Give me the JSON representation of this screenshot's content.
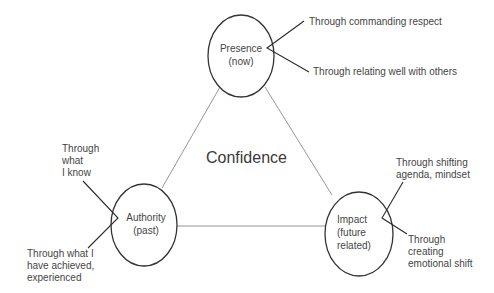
{
  "diagram": {
    "center_label": "Confidence",
    "nodes": [
      {
        "id": "presence",
        "label": [
          "Presence",
          "(now)"
        ],
        "annotations": [
          {
            "text": [
              "Through commanding respect"
            ]
          },
          {
            "text": [
              "Through relating well with others"
            ]
          }
        ]
      },
      {
        "id": "authority",
        "label": [
          "Authority",
          "(past)"
        ],
        "annotations": [
          {
            "text": [
              "Through",
              "what",
              "I know"
            ]
          },
          {
            "text": [
              "Through what I",
              "have achieved,",
              "experienced"
            ]
          }
        ]
      },
      {
        "id": "impact",
        "label": [
          "Impact",
          "(future",
          "related)"
        ],
        "annotations": [
          {
            "text": [
              "Through shifting",
              "agenda, mindset"
            ]
          },
          {
            "text": [
              "Through",
              "creating",
              "emotional shift"
            ]
          }
        ]
      }
    ],
    "edges": [
      {
        "from": "presence",
        "to": "authority"
      },
      {
        "from": "presence",
        "to": "impact"
      },
      {
        "from": "authority",
        "to": "impact"
      }
    ],
    "colors": {
      "circle_stroke": "#333333",
      "edge_stroke": "#7a7a7a",
      "callout_stroke": "#2a2a2a",
      "text": "#454545"
    }
  }
}
